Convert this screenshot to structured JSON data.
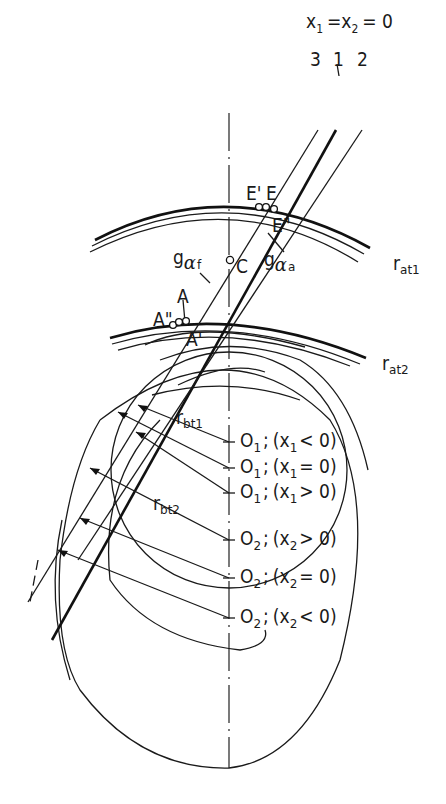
{
  "figure": {
    "title_eq": {
      "x1": "x",
      "s1": "1",
      "eq1": "=",
      "x2": "x",
      "s2": "2",
      "eq2": "= 0"
    },
    "line_numbers": [
      "3",
      "1",
      "2"
    ],
    "points": {
      "E_prime": "E'",
      "E": "E",
      "E_dprime": "E\"",
      "C": "C",
      "A": "A",
      "A_dprime": "A\"",
      "A_prime": "A'"
    },
    "lines": {
      "g_af": {
        "g": "g",
        "alpha": "α",
        "sub": "f"
      },
      "g_aa": {
        "g": "g",
        "alpha": "α",
        "sub": "a"
      }
    },
    "radii": {
      "r_at1": {
        "r": "r",
        "sub": "at1"
      },
      "r_at2": {
        "r": "r",
        "sub": "at2"
      },
      "r_bt1": {
        "r": "r",
        "sub": "bt1"
      },
      "r_bt2": {
        "r": "r",
        "sub": "bt2"
      }
    },
    "centers": [
      {
        "o": "O",
        "os": "1",
        "sep": ";",
        "cond": "(x",
        "cs": "1",
        "rel": "< 0)"
      },
      {
        "o": "O",
        "os": "1",
        "sep": ";",
        "cond": "(x",
        "cs": "1",
        "rel": "= 0)"
      },
      {
        "o": "O",
        "os": "1",
        "sep": ";",
        "cond": "(x",
        "cs": "1",
        "rel": "> 0)"
      },
      {
        "o": "O",
        "os": "2",
        "sep": ";",
        "cond": "(x",
        "cs": "2",
        "rel": "> 0)"
      },
      {
        "o": "O",
        "os": "2",
        "sep": ";",
        "cond": "(x",
        "cs": "2",
        "rel": "= 0)"
      },
      {
        "o": "O",
        "os": "2",
        "sep": ";",
        "cond": "(x",
        "cs": "2",
        "rel": "< 0)"
      }
    ]
  }
}
